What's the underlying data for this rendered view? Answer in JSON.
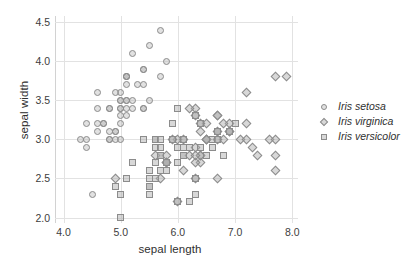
{
  "chart_data": {
    "type": "scatter",
    "title": "",
    "xlabel": "sepal length",
    "ylabel": "sepal width",
    "xlim": [
      3.85,
      8.1
    ],
    "ylim": [
      1.93,
      4.58
    ],
    "xticks": [
      "4.0",
      "5.0",
      "6.0",
      "7.0",
      "8.0"
    ],
    "xtick_values": [
      4.0,
      5.0,
      6.0,
      7.0,
      8.0
    ],
    "yticks": [
      "2.0",
      "2.5",
      "3.0",
      "3.5",
      "4.0",
      "4.5"
    ],
    "ytick_values": [
      2.0,
      2.5,
      3.0,
      3.5,
      4.0,
      4.5
    ],
    "grid": true,
    "legend_position": "right",
    "series": [
      {
        "name": "Iris setosa",
        "marker": "circle",
        "color": "#afafaf",
        "edge_color": "#8c8c8c",
        "points": [
          [
            5.1,
            3.5
          ],
          [
            4.9,
            3.0
          ],
          [
            4.7,
            3.2
          ],
          [
            4.6,
            3.1
          ],
          [
            5.0,
            3.6
          ],
          [
            5.4,
            3.9
          ],
          [
            4.6,
            3.4
          ],
          [
            5.0,
            3.4
          ],
          [
            4.4,
            2.9
          ],
          [
            4.9,
            3.1
          ],
          [
            5.4,
            3.7
          ],
          [
            4.8,
            3.4
          ],
          [
            4.8,
            3.0
          ],
          [
            4.3,
            3.0
          ],
          [
            5.8,
            4.0
          ],
          [
            5.7,
            4.4
          ],
          [
            5.4,
            3.9
          ],
          [
            5.1,
            3.5
          ],
          [
            5.7,
            3.8
          ],
          [
            5.1,
            3.8
          ],
          [
            5.4,
            3.4
          ],
          [
            5.1,
            3.7
          ],
          [
            4.6,
            3.6
          ],
          [
            5.1,
            3.3
          ],
          [
            4.8,
            3.4
          ],
          [
            5.0,
            3.0
          ],
          [
            5.0,
            3.4
          ],
          [
            5.2,
            3.5
          ],
          [
            5.2,
            3.4
          ],
          [
            4.7,
            3.2
          ],
          [
            4.8,
            3.1
          ],
          [
            5.4,
            3.4
          ],
          [
            5.2,
            4.1
          ],
          [
            5.5,
            4.2
          ],
          [
            4.9,
            3.1
          ],
          [
            5.0,
            3.2
          ],
          [
            5.5,
            3.5
          ],
          [
            4.9,
            3.6
          ],
          [
            4.4,
            3.0
          ],
          [
            5.1,
            3.4
          ],
          [
            5.0,
            3.5
          ],
          [
            4.5,
            2.3
          ],
          [
            4.4,
            3.2
          ],
          [
            5.0,
            3.5
          ],
          [
            5.1,
            3.8
          ],
          [
            4.8,
            3.0
          ],
          [
            5.1,
            3.8
          ],
          [
            4.6,
            3.2
          ],
          [
            5.3,
            3.7
          ],
          [
            5.0,
            3.3
          ]
        ]
      },
      {
        "name": "Iris virginica",
        "marker": "diamond",
        "color": "#a8a8a8",
        "edge_color": "#8c8c8c",
        "points": [
          [
            6.3,
            3.3
          ],
          [
            5.8,
            2.7
          ],
          [
            7.1,
            3.0
          ],
          [
            6.3,
            2.9
          ],
          [
            6.5,
            3.0
          ],
          [
            7.6,
            3.0
          ],
          [
            4.9,
            2.5
          ],
          [
            7.3,
            2.9
          ],
          [
            6.7,
            2.5
          ],
          [
            7.2,
            3.6
          ],
          [
            6.5,
            3.2
          ],
          [
            6.4,
            2.7
          ],
          [
            6.8,
            3.0
          ],
          [
            5.7,
            2.5
          ],
          [
            5.8,
            2.8
          ],
          [
            6.4,
            3.2
          ],
          [
            6.5,
            3.0
          ],
          [
            7.7,
            3.8
          ],
          [
            7.7,
            2.6
          ],
          [
            6.0,
            2.2
          ],
          [
            6.9,
            3.2
          ],
          [
            5.6,
            2.8
          ],
          [
            7.7,
            2.8
          ],
          [
            6.3,
            2.7
          ],
          [
            6.7,
            3.3
          ],
          [
            7.2,
            3.2
          ],
          [
            6.2,
            2.8
          ],
          [
            6.1,
            3.0
          ],
          [
            6.4,
            2.8
          ],
          [
            7.2,
            3.0
          ],
          [
            7.4,
            2.8
          ],
          [
            7.9,
            3.8
          ],
          [
            6.4,
            2.8
          ],
          [
            6.3,
            2.8
          ],
          [
            6.1,
            2.6
          ],
          [
            7.7,
            3.0
          ],
          [
            6.3,
            3.4
          ],
          [
            6.4,
            3.1
          ],
          [
            6.0,
            3.0
          ],
          [
            6.9,
            3.1
          ],
          [
            6.7,
            3.1
          ],
          [
            6.9,
            3.1
          ],
          [
            5.8,
            2.7
          ],
          [
            6.8,
            3.2
          ],
          [
            6.7,
            3.3
          ],
          [
            6.7,
            3.0
          ],
          [
            6.3,
            2.5
          ],
          [
            6.5,
            3.0
          ],
          [
            6.2,
            3.4
          ],
          [
            5.9,
            3.0
          ]
        ]
      },
      {
        "name": "Iris versicolor",
        "marker": "square",
        "color": "#a8a8a8",
        "edge_color": "#8c8c8c",
        "points": [
          [
            7.0,
            3.2
          ],
          [
            6.4,
            3.2
          ],
          [
            6.9,
            3.1
          ],
          [
            5.5,
            2.3
          ],
          [
            6.5,
            2.8
          ],
          [
            5.7,
            2.8
          ],
          [
            6.3,
            3.3
          ],
          [
            4.9,
            2.4
          ],
          [
            6.6,
            2.9
          ],
          [
            5.2,
            2.7
          ],
          [
            5.0,
            2.0
          ],
          [
            5.9,
            3.0
          ],
          [
            6.0,
            2.2
          ],
          [
            6.1,
            2.9
          ],
          [
            5.6,
            2.9
          ],
          [
            6.7,
            3.1
          ],
          [
            5.6,
            3.0
          ],
          [
            5.8,
            2.7
          ],
          [
            6.2,
            2.2
          ],
          [
            5.6,
            2.5
          ],
          [
            5.9,
            3.2
          ],
          [
            6.1,
            2.8
          ],
          [
            6.3,
            2.5
          ],
          [
            6.1,
            2.8
          ],
          [
            6.4,
            2.9
          ],
          [
            6.6,
            3.0
          ],
          [
            6.8,
            2.8
          ],
          [
            6.7,
            3.0
          ],
          [
            6.0,
            2.9
          ],
          [
            5.7,
            2.6
          ],
          [
            5.5,
            2.4
          ],
          [
            5.5,
            2.4
          ],
          [
            5.8,
            2.7
          ],
          [
            6.0,
            2.7
          ],
          [
            5.4,
            3.0
          ],
          [
            6.0,
            3.4
          ],
          [
            6.7,
            3.1
          ],
          [
            6.3,
            2.3
          ],
          [
            5.6,
            3.0
          ],
          [
            5.5,
            2.5
          ],
          [
            5.5,
            2.6
          ],
          [
            6.1,
            3.0
          ],
          [
            5.8,
            2.6
          ],
          [
            5.0,
            2.3
          ],
          [
            5.6,
            2.7
          ],
          [
            5.7,
            3.0
          ],
          [
            5.7,
            2.9
          ],
          [
            6.2,
            2.9
          ],
          [
            5.1,
            2.5
          ],
          [
            5.7,
            2.8
          ]
        ]
      }
    ]
  },
  "axes": {
    "xlabel": "sepal length",
    "ylabel": "sepal width"
  },
  "legend": {
    "items": [
      {
        "label": "Iris setosa",
        "marker": "circle"
      },
      {
        "label": "Iris virginica",
        "marker": "diamond"
      },
      {
        "label": "Iris versicolor",
        "marker": "square"
      }
    ]
  }
}
